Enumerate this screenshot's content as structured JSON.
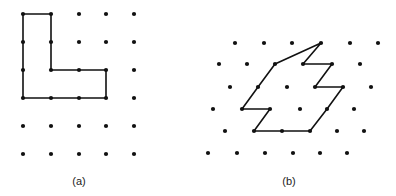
{
  "figure_a": {
    "label": "(a)",
    "label_pos": [
      79,
      185
    ],
    "dots": [
      [
        23,
        14
      ],
      [
        51,
        14
      ],
      [
        79,
        14
      ],
      [
        106,
        14
      ],
      [
        134,
        14
      ],
      [
        23,
        42
      ],
      [
        51,
        42
      ],
      [
        79,
        42
      ],
      [
        106,
        42
      ],
      [
        134,
        42
      ],
      [
        23,
        70
      ],
      [
        51,
        70
      ],
      [
        79,
        70
      ],
      [
        106,
        70
      ],
      [
        134,
        70
      ],
      [
        23,
        98
      ],
      [
        51,
        98
      ],
      [
        79,
        98
      ],
      [
        106,
        98
      ],
      [
        134,
        98
      ],
      [
        23,
        126
      ],
      [
        51,
        126
      ],
      [
        79,
        126
      ],
      [
        106,
        126
      ],
      [
        134,
        126
      ],
      [
        23,
        154
      ],
      [
        51,
        154
      ],
      [
        79,
        154
      ],
      [
        106,
        154
      ],
      [
        134,
        154
      ]
    ],
    "polygon": [
      [
        23,
        14
      ],
      [
        51,
        14
      ],
      [
        51,
        42
      ],
      [
        51,
        70
      ],
      [
        79,
        70
      ],
      [
        106,
        70
      ],
      [
        106,
        98
      ],
      [
        79,
        98
      ],
      [
        51,
        98
      ],
      [
        23,
        98
      ],
      [
        23,
        70
      ],
      [
        23,
        42
      ]
    ]
  },
  "figure_b": {
    "label": "(b)",
    "label_pos": [
      289,
      185
    ],
    "dots": [
      [
        235,
        43
      ],
      [
        264,
        43
      ],
      [
        292,
        43
      ],
      [
        321,
        43
      ],
      [
        350,
        43
      ],
      [
        378,
        43
      ],
      [
        219,
        64
      ],
      [
        247,
        64
      ],
      [
        275,
        64
      ],
      [
        303,
        64
      ],
      [
        332,
        64
      ],
      [
        360,
        64
      ],
      [
        230,
        87
      ],
      [
        258,
        87
      ],
      [
        287,
        87
      ],
      [
        315,
        87
      ],
      [
        343,
        87
      ],
      [
        371,
        87
      ],
      [
        213,
        109
      ],
      [
        242,
        109
      ],
      [
        270,
        109
      ],
      [
        300,
        109
      ],
      [
        327,
        109
      ],
      [
        354,
        109
      ],
      [
        225,
        131
      ],
      [
        254,
        131
      ],
      [
        282,
        131
      ],
      [
        310,
        131
      ],
      [
        337,
        131
      ],
      [
        364,
        131
      ],
      [
        208,
        153
      ],
      [
        237,
        153
      ],
      [
        265,
        153
      ],
      [
        293,
        153
      ],
      [
        320,
        153
      ],
      [
        347,
        153
      ]
    ],
    "polygon": [
      [
        321,
        43
      ],
      [
        303,
        64
      ],
      [
        332,
        64
      ],
      [
        315,
        87
      ],
      [
        343,
        87
      ],
      [
        327,
        109
      ],
      [
        310,
        131
      ],
      [
        282,
        131
      ],
      [
        254,
        131
      ],
      [
        270,
        109
      ],
      [
        242,
        109
      ],
      [
        258,
        87
      ],
      [
        275,
        64
      ]
    ]
  },
  "colors": {
    "dot": "#111111",
    "edge": "#111111",
    "background": "#ffffff"
  }
}
